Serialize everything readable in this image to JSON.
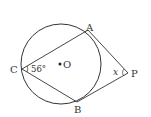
{
  "diagram": {
    "points": {
      "A": "A",
      "B": "B",
      "C": "C",
      "O": "O",
      "P": "P"
    },
    "angle_C": "56°",
    "angle_P": "x",
    "colors": {
      "stroke": "#333333",
      "background": "#ffffff"
    }
  }
}
